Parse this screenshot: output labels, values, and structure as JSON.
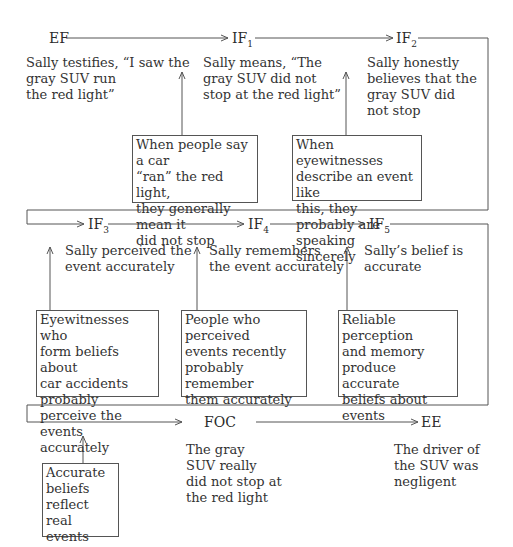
{
  "nodes": {
    "ef": {
      "label": "EF",
      "text": "Sally testifies, “I saw the\ngray SUV run\nthe red light”"
    },
    "if1": {
      "label": "IF",
      "sub": "1",
      "text": "Sally means, “The\ngray SUV did not\nstop at the red light”"
    },
    "if2": {
      "label": "IF",
      "sub": "2",
      "text": "Sally honestly\nbelieves that the\ngray SUV did\nnot stop"
    },
    "if3": {
      "label": "IF",
      "sub": "3",
      "text": "Sally perceived the\nevent accurately"
    },
    "if4": {
      "label": "IF",
      "sub": "4",
      "text": "Sally remembers\nthe event accurately"
    },
    "if5": {
      "label": "IF",
      "sub": "5",
      "text": "Sally’s belief is\naccurate"
    },
    "foc": {
      "label": "FOC",
      "text": "The gray\nSUV really\ndid not stop at\nthe red light"
    },
    "ee": {
      "label": "EE",
      "text": "The driver of\nthe SUV was\nnegligent"
    }
  },
  "generalizations": {
    "g1": "When people say a car\n“ran” the red light,\nthey generally mean it\ndid not stop",
    "g2": "When eyewitnesses\ndescribe an event like\nthis, they probably are\nspeaking sincerely",
    "g3": "Eyewitnesses who\nform beliefs about\ncar accidents\nprobably perceive the\nevents accurately",
    "g4": "People who perceived\nevents recently\nprobably remember\nthem accurately",
    "g5": "Reliable perception\nand memory\nproduce accurate\nbeliefs about events",
    "g6": "Accurate\nbeliefs\nreflect\nreal events"
  },
  "colors": {
    "line": "#555555",
    "text": "#333333"
  }
}
